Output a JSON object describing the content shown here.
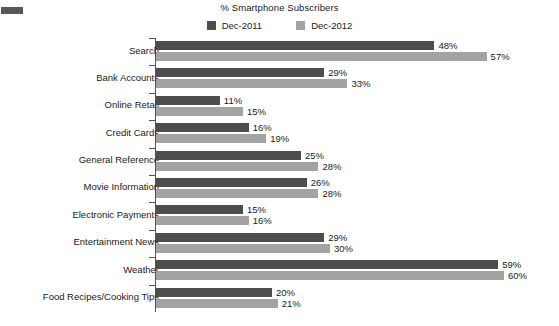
{
  "chart_data": {
    "type": "bar",
    "orientation": "horizontal",
    "title": "% Smartphone Subscribers",
    "xlabel": "",
    "ylabel": "",
    "xlim": [
      0,
      60
    ],
    "grid": false,
    "legend_position": "top-center",
    "axis_line": true,
    "value_label_suffix": "%",
    "categories": [
      "Search",
      "Bank Accounts",
      "Online Retail",
      "Credit Cards",
      "General Reference",
      "Movie Information",
      "Electronic Payments",
      "Entertainment News",
      "Weather",
      "Food Recipes/Cooking Tips"
    ],
    "series": [
      {
        "name": "Dec-2011",
        "color": "#4d4d4d",
        "values": [
          48,
          29,
          11,
          16,
          25,
          26,
          15,
          29,
          59,
          20
        ],
        "labels": [
          "48%",
          "29%",
          "11%",
          "16%",
          "25%",
          "26%",
          "15%",
          "29%",
          "59%",
          "20%"
        ]
      },
      {
        "name": "Dec-2012",
        "color": "#a3a3a3",
        "values": [
          57,
          33,
          15,
          19,
          28,
          28,
          16,
          30,
          60,
          21
        ],
        "labels": [
          "57%",
          "33%",
          "15%",
          "19%",
          "28%",
          "28%",
          "16%",
          "30%",
          "60%",
          "21%"
        ]
      }
    ]
  },
  "legend": {
    "items": [
      {
        "label": "Dec-2011",
        "color": "#4d4d4d"
      },
      {
        "label": "Dec-2012",
        "color": "#a3a3a3"
      }
    ]
  }
}
